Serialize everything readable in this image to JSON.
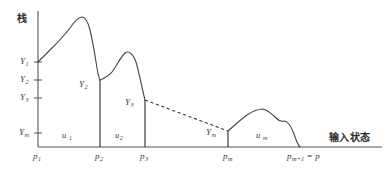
{
  "figure": {
    "axes": {
      "y_axis_label": "栈",
      "x_axis_label": "输入状态",
      "y_axis_label_name": "stack",
      "x_axis_label_name": "input-state"
    },
    "y_ticks": [
      {
        "label": "Y",
        "sub": "1",
        "y": 62
      },
      {
        "label": "Y",
        "sub": "2",
        "y": 80
      },
      {
        "label": "Y",
        "sub": "3",
        "y": 98
      },
      {
        "label": "Y",
        "sub": "m",
        "y": 133
      }
    ],
    "x_ticks": [
      {
        "label": "p",
        "sub": "1",
        "x": 38
      },
      {
        "label": "p",
        "sub": "2",
        "x": 100
      },
      {
        "label": "p",
        "sub": "3",
        "x": 145
      },
      {
        "label": "p",
        "sub": "m",
        "x": 228
      },
      {
        "label": "p",
        "sub": "m+1",
        "suffix": "= p",
        "x": 300
      }
    ],
    "interval_labels": [
      {
        "label": "u",
        "sub": "1",
        "x": 64,
        "y": 136
      },
      {
        "label": "u",
        "sub": "2",
        "x": 117,
        "y": 136
      },
      {
        "label": "u",
        "sub": "m",
        "x": 258,
        "y": 136
      }
    ],
    "curve_point_labels": [
      {
        "label": "Y",
        "sub": "2",
        "x": 82,
        "y": 85
      },
      {
        "label": "Y",
        "sub": "3",
        "x": 128,
        "y": 103
      },
      {
        "label": "Y",
        "sub": "m",
        "x": 208,
        "y": 134
      }
    ],
    "colors": {
      "ink": "#3b3b3b",
      "curve": "#444444",
      "axis": "#555555",
      "dashed": "#3b3b3b",
      "background": "#ffffff"
    }
  },
  "chart_data": {
    "type": "line",
    "title": "",
    "xlabel": "输入状态",
    "ylabel": "栈",
    "grid": false,
    "legend": null,
    "xlim": [
      38,
      386
    ],
    "ylim": [
      147,
      10
    ],
    "axis_origin": {
      "x": 38,
      "y": 147
    },
    "y_tick_labels": [
      "Y1",
      "Y2",
      "Y3",
      "Ym"
    ],
    "y_tick_pixel_positions": [
      62,
      80,
      98,
      133
    ],
    "x_tick_labels": [
      "p1",
      "p2",
      "p3",
      "pm",
      "pm+1 = p"
    ],
    "x_tick_pixel_positions": [
      38,
      100,
      145,
      228,
      300
    ],
    "segments": [
      {
        "name": "segment-u1",
        "from_label": "Y1",
        "to_label": "Y2",
        "start": [
          38,
          62
        ],
        "end": [
          100,
          80
        ],
        "peak": [
          82,
          17
        ],
        "path": "M38,62 C42,58 46,54 52,48 C58,42 64,36 70,28 C74,22 78,17 82,17 C86,17 88,22 90,30 C93,42 95,56 97,68 C98,74 99,78 100,80"
      },
      {
        "name": "segment-u2",
        "from_label": "Y2",
        "to_label": "Y3",
        "start": [
          100,
          80
        ],
        "end": [
          145,
          100
        ],
        "peak": [
          125,
          52
        ],
        "path": "M100,80 C104,78 108,77 112,72 C116,67 120,58 125,53 C129,50 133,54 136,62 C139,72 142,88 145,100"
      },
      {
        "name": "segment-dashed-gap",
        "style": "dashed",
        "from_label": "Y3",
        "to_label": "Ym",
        "start": [
          145,
          100
        ],
        "end": [
          228,
          131
        ],
        "path": "M145,100 L228,131"
      },
      {
        "name": "segment-um",
        "from_label": "Ym",
        "to_label": "pm+1",
        "start": [
          228,
          131
        ],
        "end": [
          300,
          147
        ],
        "peak": [
          262,
          110
        ],
        "path": "M228,131 C234,126 240,120 247,115 C253,111 258,109 263,109 C268,110 272,114 276,118 C279,121 281,122 284,121 C288,121 291,126 294,134 C296,140 298,145 300,147"
      }
    ],
    "drop_lines": [
      {
        "name": "drop-p2",
        "x": 100,
        "from_y": 80,
        "to_y": 147
      },
      {
        "name": "drop-p3",
        "x": 145,
        "from_y": 100,
        "to_y": 147
      },
      {
        "name": "drop-pm",
        "x": 228,
        "from_y": 131,
        "to_y": 147
      }
    ]
  }
}
